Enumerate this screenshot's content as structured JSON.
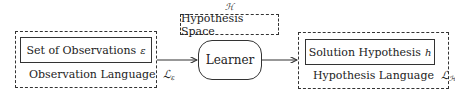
{
  "diagram": {
    "input": {
      "box_label": "Set of Observations",
      "box_symbol": "ε",
      "container_label": "Observation Language",
      "container_symbol": "ℒ",
      "container_symbol_sub": "ε"
    },
    "hypothesis_space": {
      "symbol": "ℋ",
      "label": "Hypothesis Space"
    },
    "learner": {
      "label": "Learner"
    },
    "output": {
      "box_label": "Solution Hypothesis",
      "box_symbol": "h",
      "container_label": "Hypothesis Language",
      "container_symbol": "ℒ",
      "container_symbol_sub": "ℋ"
    },
    "edges": [
      {
        "from": "input",
        "to": "learner"
      },
      {
        "from": "learner",
        "to": "output"
      }
    ]
  }
}
